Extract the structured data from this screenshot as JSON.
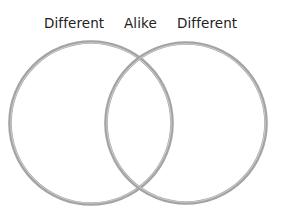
{
  "venn": {
    "labels": {
      "left": "Different",
      "center": "Alike",
      "right": "Different"
    },
    "circles": [
      {
        "name": "left-set",
        "cx": 91,
        "cy": 123,
        "r": 81
      },
      {
        "name": "right-set",
        "cx": 186,
        "cy": 123,
        "r": 80
      }
    ],
    "stroke_color": "#9a9a9a",
    "stroke_highlight": "#c8c8c8"
  }
}
